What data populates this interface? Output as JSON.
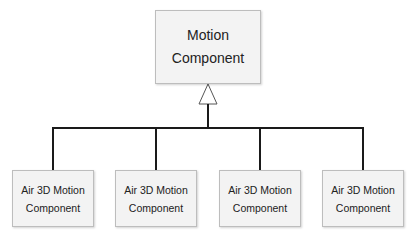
{
  "diagram": {
    "type": "uml-inheritance",
    "parent": {
      "line1": "Motion",
      "line2": "Component"
    },
    "children": [
      {
        "line1": "Air 3D Motion",
        "line2": "Component"
      },
      {
        "line1": "Air 3D Motion",
        "line2": "Component"
      },
      {
        "line1": "Air 3D Motion",
        "line2": "Component"
      },
      {
        "line1": "Air 3D Motion",
        "line2": "Component"
      }
    ],
    "colors": {
      "line": "#1a1a1a",
      "box_fill": "#f3f3f3",
      "box_border": "#bdbdbd"
    }
  }
}
